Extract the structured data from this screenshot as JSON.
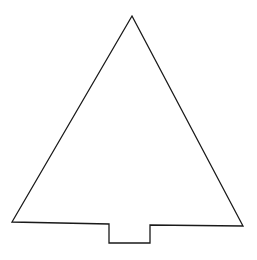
{
  "figure": {
    "stroke_color": "#1a1a1a",
    "background": "#ffffff",
    "stroke_width": 1.3,
    "outline_points": [
      [
        132,
        16
      ],
      [
        243,
        226
      ],
      [
        150,
        225
      ],
      [
        150,
        243
      ],
      [
        109,
        243
      ],
      [
        109,
        224
      ],
      [
        12,
        222
      ]
    ]
  }
}
